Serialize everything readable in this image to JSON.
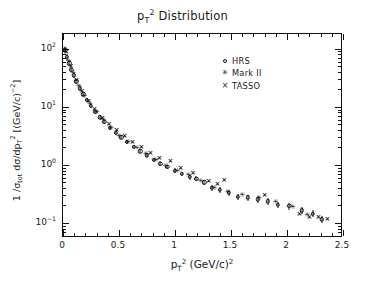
{
  "chart_data": {
    "type": "scatter",
    "title_html": "p<sub>T</sub><sup>2</sup> Distribution",
    "xlabel": "p_T^2 (GeV/c)^2",
    "xlabel_html": "p<sub>T</sub><sup>2</sup> (GeV/c)<sup>2</sup>",
    "ylabel": "1/σ_tot dσ/dp_T^2 [(GeV/c)^-2]",
    "ylabel_html": "1 /σ<sub>tot</sub> dσ/dp<sub>T</sub><sup>2</sup> [(GeV/c)<sup>−2</sup>]",
    "xlim": [
      0,
      2.5
    ],
    "ylim": [
      0.055,
      180
    ],
    "yscale": "log",
    "xscale": "linear",
    "grid": false,
    "legend_position": "upper right",
    "xticks": [
      0,
      0.5,
      1,
      1.5,
      2,
      2.5
    ],
    "xtick_labels": [
      "0",
      "0.5",
      "1",
      "1.5",
      "2",
      "2.5"
    ],
    "xminor_step": 0.1,
    "yticks": [
      100,
      10,
      1,
      0.1
    ],
    "ytick_labels": [
      "10^2",
      "10^1",
      "10^0",
      "10^-1"
    ],
    "ytick_labels_html": [
      "10<sup>2</sup>",
      "10<sup>1</sup>",
      "10<sup>0</sup>",
      "10<sup>−1</sup>"
    ],
    "series": [
      {
        "name": "HRS",
        "marker": "open-circle",
        "points": [
          {
            "x": 0.015,
            "y": 95.0,
            "err": 0.12
          },
          {
            "x": 0.035,
            "y": 72.0,
            "err": 0.11
          },
          {
            "x": 0.055,
            "y": 56.0,
            "err": 0.1
          },
          {
            "x": 0.075,
            "y": 44.0,
            "err": 0.1
          },
          {
            "x": 0.095,
            "y": 35.0,
            "err": 0.09
          },
          {
            "x": 0.12,
            "y": 27.5,
            "err": 0.09
          },
          {
            "x": 0.15,
            "y": 21.0,
            "err": 0.09
          },
          {
            "x": 0.18,
            "y": 16.5,
            "err": 0.08
          },
          {
            "x": 0.21,
            "y": 13.2,
            "err": 0.08
          },
          {
            "x": 0.25,
            "y": 10.3,
            "err": 0.08
          },
          {
            "x": 0.29,
            "y": 8.3,
            "err": 0.08
          },
          {
            "x": 0.33,
            "y": 6.6,
            "err": 0.08
          },
          {
            "x": 0.37,
            "y": 5.5,
            "err": 0.08
          },
          {
            "x": 0.42,
            "y": 4.4,
            "err": 0.08
          },
          {
            "x": 0.47,
            "y": 3.6,
            "err": 0.08
          },
          {
            "x": 0.52,
            "y": 3.0,
            "err": 0.08
          },
          {
            "x": 0.57,
            "y": 2.5,
            "err": 0.08
          },
          {
            "x": 0.63,
            "y": 2.05,
            "err": 0.08
          },
          {
            "x": 0.69,
            "y": 1.72,
            "err": 0.08
          },
          {
            "x": 0.75,
            "y": 1.46,
            "err": 0.08
          },
          {
            "x": 0.81,
            "y": 1.22,
            "err": 0.09
          },
          {
            "x": 0.87,
            "y": 1.05,
            "err": 0.09
          },
          {
            "x": 0.93,
            "y": 0.93,
            "err": 0.09
          },
          {
            "x": 1.0,
            "y": 0.8,
            "err": 0.09
          },
          {
            "x": 1.06,
            "y": 0.7,
            "err": 0.09
          },
          {
            "x": 1.13,
            "y": 0.62,
            "err": 0.1
          },
          {
            "x": 1.19,
            "y": 0.58,
            "err": 0.1
          },
          {
            "x": 1.26,
            "y": 0.5,
            "err": 0.1
          },
          {
            "x": 1.33,
            "y": 0.4,
            "err": 0.11
          },
          {
            "x": 1.4,
            "y": 0.37,
            "err": 0.11
          },
          {
            "x": 1.48,
            "y": 0.33,
            "err": 0.11
          },
          {
            "x": 1.56,
            "y": 0.285,
            "err": 0.12
          },
          {
            "x": 1.65,
            "y": 0.275,
            "err": 0.12
          },
          {
            "x": 1.74,
            "y": 0.255,
            "err": 0.12
          },
          {
            "x": 1.83,
            "y": 0.235,
            "err": 0.13
          },
          {
            "x": 1.92,
            "y": 0.205,
            "err": 0.13
          },
          {
            "x": 2.02,
            "y": 0.195,
            "err": 0.13
          },
          {
            "x": 2.13,
            "y": 0.165,
            "err": 0.14
          },
          {
            "x": 2.23,
            "y": 0.145,
            "err": 0.14
          },
          {
            "x": 2.31,
            "y": 0.115,
            "err": 0.15
          }
        ]
      },
      {
        "name": "Mark II",
        "marker": "star",
        "points": [
          {
            "x": 0.02,
            "y": 100.0
          },
          {
            "x": 0.05,
            "y": 62.0
          },
          {
            "x": 0.09,
            "y": 38.0
          },
          {
            "x": 0.14,
            "y": 23.0
          },
          {
            "x": 0.19,
            "y": 15.5
          },
          {
            "x": 0.24,
            "y": 11.0
          },
          {
            "x": 0.3,
            "y": 8.0
          },
          {
            "x": 0.36,
            "y": 5.9
          },
          {
            "x": 0.43,
            "y": 4.3
          },
          {
            "x": 0.5,
            "y": 3.2
          },
          {
            "x": 0.58,
            "y": 2.45
          },
          {
            "x": 0.66,
            "y": 1.95
          },
          {
            "x": 0.74,
            "y": 1.52
          },
          {
            "x": 0.83,
            "y": 1.2
          },
          {
            "x": 0.92,
            "y": 0.96
          },
          {
            "x": 1.02,
            "y": 0.77
          },
          {
            "x": 1.12,
            "y": 0.66
          },
          {
            "x": 1.23,
            "y": 0.52
          },
          {
            "x": 1.35,
            "y": 0.4
          },
          {
            "x": 1.47,
            "y": 0.345
          },
          {
            "x": 1.6,
            "y": 0.3
          },
          {
            "x": 1.75,
            "y": 0.265
          },
          {
            "x": 1.9,
            "y": 0.225
          },
          {
            "x": 2.05,
            "y": 0.185
          },
          {
            "x": 2.18,
            "y": 0.135
          }
        ]
      },
      {
        "name": "TASSO",
        "marker": "cross",
        "points": [
          {
            "x": 0.03,
            "y": 88.0
          },
          {
            "x": 0.07,
            "y": 50.0
          },
          {
            "x": 0.12,
            "y": 29.0
          },
          {
            "x": 0.17,
            "y": 19.0
          },
          {
            "x": 0.23,
            "y": 12.5
          },
          {
            "x": 0.28,
            "y": 9.3
          },
          {
            "x": 0.35,
            "y": 6.5
          },
          {
            "x": 0.41,
            "y": 5.0
          },
          {
            "x": 0.48,
            "y": 4.0
          },
          {
            "x": 0.55,
            "y": 3.1
          },
          {
            "x": 0.62,
            "y": 2.5
          },
          {
            "x": 0.7,
            "y": 2.05
          },
          {
            "x": 0.78,
            "y": 1.62
          },
          {
            "x": 0.86,
            "y": 1.3
          },
          {
            "x": 0.96,
            "y": 1.18
          },
          {
            "x": 1.05,
            "y": 0.88
          },
          {
            "x": 1.16,
            "y": 0.72
          },
          {
            "x": 1.3,
            "y": 0.52
          },
          {
            "x": 1.38,
            "y": 0.46
          },
          {
            "x": 1.44,
            "y": 0.54
          },
          {
            "x": 1.8,
            "y": 0.3
          },
          {
            "x": 2.11,
            "y": 0.145
          },
          {
            "x": 2.2,
            "y": 0.125
          },
          {
            "x": 2.28,
            "y": 0.125
          },
          {
            "x": 2.36,
            "y": 0.115
          }
        ]
      }
    ]
  },
  "legend": {
    "items": [
      {
        "label": "HRS",
        "marker": "○"
      },
      {
        "label": "Mark II",
        "marker": "✳"
      },
      {
        "label": "TASSO",
        "marker": "×"
      }
    ]
  }
}
